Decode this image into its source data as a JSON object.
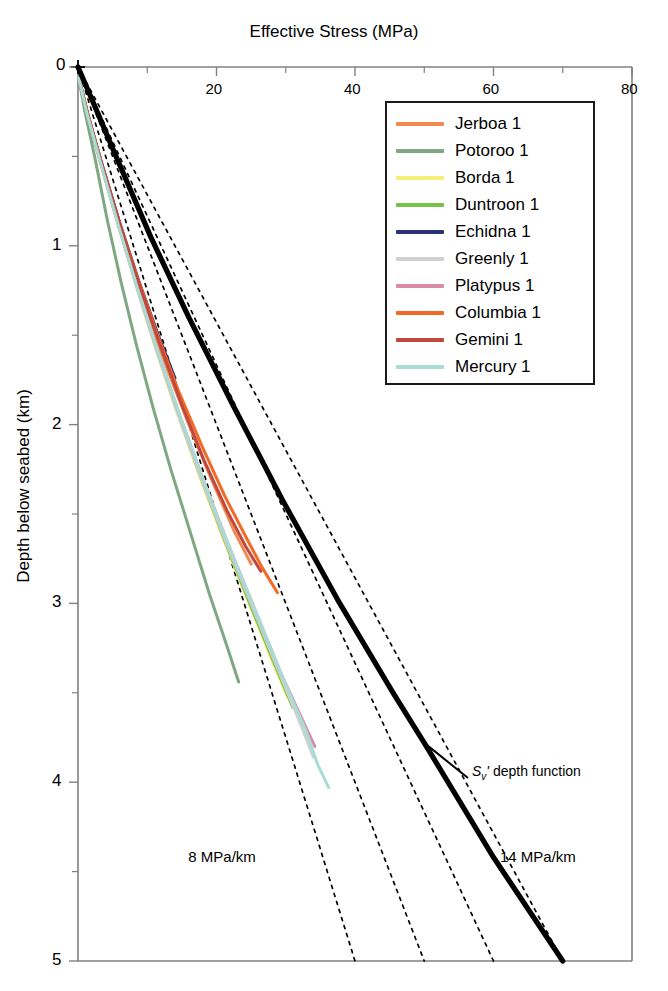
{
  "chart_data": {
    "type": "line",
    "title": "",
    "xlabel": "Effective Stress (MPa)",
    "ylabel": "Depth below seabed (km)",
    "xlim": [
      0,
      80
    ],
    "ylim": [
      0,
      5
    ],
    "y_inverted": true,
    "x_axis_position": "top",
    "grid": false,
    "xticks": [
      0,
      20,
      40,
      60,
      80
    ],
    "xticklabels": [
      "0",
      "20",
      "40",
      "60",
      "80"
    ],
    "xminorticks": [
      10,
      30,
      50,
      70
    ],
    "yticks": [
      0,
      1,
      2,
      3,
      4,
      5
    ],
    "yticklabels": [
      "0",
      "1",
      "2",
      "3",
      "4",
      "5"
    ],
    "yminorticks": [
      0.5,
      1.5,
      2.5,
      3.5,
      4.5
    ],
    "legend_position": "upper right",
    "series": [
      {
        "name": "Jerboa 1",
        "color": "#f08a50",
        "points": [
          [
            0.1,
            0.06
          ],
          [
            1.2,
            0.25
          ],
          [
            3.0,
            0.5
          ],
          [
            5.2,
            0.8
          ],
          [
            7.6,
            1.1
          ],
          [
            10.2,
            1.4
          ],
          [
            13.0,
            1.7
          ],
          [
            16.0,
            2.0
          ],
          [
            19.2,
            2.3
          ],
          [
            22.6,
            2.6
          ],
          [
            25.0,
            2.78
          ]
        ]
      },
      {
        "name": "Potoroo 1",
        "color": "#7fa882",
        "points": [
          [
            0.1,
            0.06
          ],
          [
            1.0,
            0.25
          ],
          [
            2.4,
            0.5
          ],
          [
            4.2,
            0.85
          ],
          [
            6.2,
            1.2
          ],
          [
            8.4,
            1.55
          ],
          [
            10.8,
            1.9
          ],
          [
            13.4,
            2.25
          ],
          [
            16.2,
            2.6
          ],
          [
            19.0,
            2.95
          ],
          [
            21.6,
            3.25
          ],
          [
            23.2,
            3.44
          ]
        ]
      },
      {
        "name": "Borda 1",
        "color": "#f5f07a",
        "points": [
          [
            0.1,
            0.06
          ],
          [
            1.3,
            0.25
          ],
          [
            3.2,
            0.52
          ],
          [
            5.6,
            0.85
          ],
          [
            8.2,
            1.2
          ],
          [
            11.0,
            1.55
          ],
          [
            14.0,
            1.9
          ],
          [
            17.2,
            2.25
          ],
          [
            20.6,
            2.6
          ],
          [
            24.2,
            2.95
          ],
          [
            27.8,
            3.3
          ],
          [
            30.2,
            3.52
          ]
        ]
      },
      {
        "name": "Duntroon 1",
        "color": "#79c24a",
        "points": [
          [
            0.1,
            0.06
          ],
          [
            1.3,
            0.25
          ],
          [
            3.2,
            0.52
          ],
          [
            5.6,
            0.85
          ],
          [
            8.3,
            1.2
          ],
          [
            11.2,
            1.56
          ],
          [
            14.3,
            1.92
          ],
          [
            17.6,
            2.28
          ],
          [
            21.1,
            2.64
          ],
          [
            24.8,
            3.0
          ],
          [
            28.5,
            3.35
          ],
          [
            31.0,
            3.58
          ]
        ]
      },
      {
        "name": "Echidna 1",
        "color": "#2b2f73",
        "points": [
          [
            0.1,
            0.06
          ],
          [
            1.5,
            0.28
          ],
          [
            3.6,
            0.56
          ],
          [
            6.1,
            0.88
          ],
          [
            8.8,
            1.2
          ],
          [
            11.6,
            1.5
          ],
          [
            14.0,
            1.74
          ]
        ]
      },
      {
        "name": "Greenly 1",
        "color": "#cfd2ce",
        "points": [
          [
            0.1,
            0.06
          ],
          [
            1.3,
            0.25
          ],
          [
            3.2,
            0.52
          ],
          [
            5.7,
            0.86
          ],
          [
            8.4,
            1.22
          ],
          [
            11.3,
            1.58
          ],
          [
            14.4,
            1.94
          ],
          [
            17.8,
            2.3
          ],
          [
            21.4,
            2.66
          ],
          [
            25.2,
            3.02
          ],
          [
            29.0,
            3.38
          ],
          [
            32.4,
            3.7
          ],
          [
            34.0,
            3.86
          ]
        ]
      },
      {
        "name": "Platypus 1",
        "color": "#d98ba8",
        "points": [
          [
            0.1,
            0.06
          ],
          [
            1.3,
            0.26
          ],
          [
            3.3,
            0.54
          ],
          [
            5.8,
            0.88
          ],
          [
            8.6,
            1.24
          ],
          [
            11.6,
            1.6
          ],
          [
            14.8,
            1.96
          ],
          [
            18.2,
            2.32
          ],
          [
            21.8,
            2.68
          ],
          [
            25.6,
            3.04
          ],
          [
            29.4,
            3.4
          ],
          [
            33.0,
            3.7
          ],
          [
            34.2,
            3.8
          ]
        ]
      },
      {
        "name": "Columbia 1",
        "color": "#f26a24",
        "points": [
          [
            0.1,
            0.06
          ],
          [
            1.4,
            0.26
          ],
          [
            3.4,
            0.54
          ],
          [
            5.9,
            0.86
          ],
          [
            8.6,
            1.18
          ],
          [
            11.5,
            1.5
          ],
          [
            14.6,
            1.82
          ],
          [
            17.9,
            2.12
          ],
          [
            21.2,
            2.4
          ],
          [
            24.4,
            2.64
          ],
          [
            26.6,
            2.8
          ],
          [
            28.8,
            2.94
          ]
        ]
      },
      {
        "name": "Gemini 1",
        "color": "#c0493f",
        "points": [
          [
            0.1,
            0.06
          ],
          [
            1.4,
            0.26
          ],
          [
            3.4,
            0.54
          ],
          [
            5.9,
            0.86
          ],
          [
            8.7,
            1.2
          ],
          [
            11.7,
            1.54
          ],
          [
            14.9,
            1.88
          ],
          [
            18.2,
            2.2
          ],
          [
            21.5,
            2.48
          ],
          [
            24.2,
            2.68
          ],
          [
            26.4,
            2.82
          ]
        ]
      },
      {
        "name": "Mercury 1",
        "color": "#a8dcd6",
        "points": [
          [
            0.1,
            0.06
          ],
          [
            1.3,
            0.26
          ],
          [
            3.3,
            0.54
          ],
          [
            5.8,
            0.88
          ],
          [
            8.6,
            1.24
          ],
          [
            11.6,
            1.6
          ],
          [
            14.8,
            1.96
          ],
          [
            18.2,
            2.32
          ],
          [
            21.8,
            2.68
          ],
          [
            25.6,
            3.04
          ],
          [
            29.4,
            3.4
          ],
          [
            33.0,
            3.72
          ],
          [
            34.6,
            3.9
          ],
          [
            36.2,
            4.03
          ]
        ]
      }
    ],
    "reference_line": {
      "name": "Sv' depth function",
      "color": "#000000",
      "label": "depth function",
      "symbol_main": "S",
      "symbol_sub": "v",
      "symbol_prime": "'",
      "points": [
        [
          0.0,
          0.0
        ],
        [
          2.0,
          0.18
        ],
        [
          5.5,
          0.5
        ],
        [
          10.5,
          0.95
        ],
        [
          16.0,
          1.4
        ],
        [
          22.5,
          1.9
        ],
        [
          29.5,
          2.42
        ],
        [
          37.5,
          2.98
        ],
        [
          45.5,
          3.5
        ],
        [
          50.0,
          3.78
        ],
        [
          60.0,
          4.42
        ],
        [
          70.0,
          5.0
        ]
      ]
    },
    "gradient_lines": [
      {
        "label": "8 MPa/km",
        "gradient_mpa_per_km": 8,
        "color": "#000000",
        "style": "dotted"
      },
      {
        "label": "",
        "gradient_mpa_per_km": 10,
        "color": "#000000",
        "style": "dotted"
      },
      {
        "label": "",
        "gradient_mpa_per_km": 12,
        "color": "#000000",
        "style": "dotted"
      },
      {
        "label": "14 MPa/km",
        "gradient_mpa_per_km": 14,
        "color": "#000000",
        "style": "dotted"
      }
    ],
    "annotations": [
      {
        "text": "8 MPa/km",
        "x_mpa": 22.0,
        "y_km": 4.42
      },
      {
        "text": "14 MPa/km",
        "x_mpa": 67.0,
        "y_km": 4.42
      }
    ]
  },
  "legend": {
    "items": [
      {
        "label": "Jerboa 1",
        "color": "#f08a50"
      },
      {
        "label": "Potoroo 1",
        "color": "#7fa882"
      },
      {
        "label": "Borda 1",
        "color": "#f5f07a"
      },
      {
        "label": "Duntroon 1",
        "color": "#79c24a"
      },
      {
        "label": "Echidna 1",
        "color": "#2b2f73"
      },
      {
        "label": "Greenly 1",
        "color": "#cfd2ce"
      },
      {
        "label": "Platypus 1",
        "color": "#d98ba8"
      },
      {
        "label": "Columbia 1",
        "color": "#f26a24"
      },
      {
        "label": "Gemini 1",
        "color": "#c0493f"
      },
      {
        "label": "Mercury 1",
        "color": "#a8dcd6"
      }
    ]
  }
}
